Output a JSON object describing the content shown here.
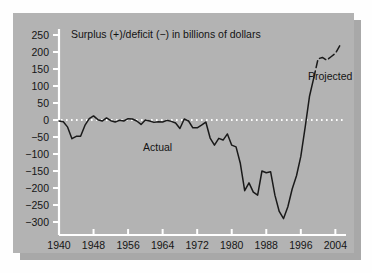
{
  "figure": {
    "panel_bg": "#b3b3b3",
    "shadow_color": "#a8a8a8",
    "page_bg": "#fefefe",
    "axis_color": "#ffffff",
    "line_color": "#1a1a1a",
    "zeroline_color": "#ffffff",
    "text_color": "#131313"
  },
  "chart_data": {
    "type": "line",
    "title": "Surplus (+)/deficit (−) in billions of dollars",
    "xlabel": "",
    "ylabel": "",
    "xlim": [
      1940,
      2006
    ],
    "ylim": [
      -300,
      250
    ],
    "grid": false,
    "legend": "none",
    "zero_line": 0,
    "xticks": [
      1940,
      1948,
      1956,
      1964,
      1972,
      1980,
      1988,
      1996,
      2004
    ],
    "xtick_labels": [
      "1940",
      "1948",
      "1956",
      "1964",
      "1972",
      "1980",
      "1988",
      "1996",
      "2004"
    ],
    "yticks": [
      250,
      200,
      150,
      100,
      50,
      0,
      -50,
      -100,
      -150,
      -200,
      -250,
      -300
    ],
    "ytick_labels": [
      "250",
      "200",
      "150",
      "100",
      "50",
      "0",
      "−50",
      "−100",
      "−150",
      "−200",
      "−250",
      "−300"
    ],
    "annotations": [
      {
        "text": "Actual",
        "x": 1966,
        "y": -55
      },
      {
        "text": "Projected",
        "x": 1999,
        "y": 160
      }
    ],
    "series": [
      {
        "name": "Actual",
        "style": "solid",
        "x": [
          1940,
          1941,
          1942,
          1943,
          1944,
          1945,
          1946,
          1947,
          1948,
          1949,
          1950,
          1951,
          1952,
          1953,
          1954,
          1955,
          1956,
          1957,
          1958,
          1959,
          1960,
          1961,
          1962,
          1963,
          1964,
          1965,
          1966,
          1967,
          1968,
          1969,
          1970,
          1971,
          1972,
          1973,
          1974,
          1975,
          1976,
          1977,
          1978,
          1979,
          1980,
          1981,
          1982,
          1983,
          1984,
          1985,
          1986,
          1987,
          1988,
          1989,
          1990,
          1991,
          1992,
          1993,
          1994,
          1995,
          1996,
          1997,
          1998,
          1999
        ],
        "values": [
          -3,
          -5,
          -21,
          -55,
          -48,
          -48,
          -16,
          4,
          12,
          1,
          -3,
          6,
          -2,
          -6,
          -1,
          -3,
          4,
          3,
          -3,
          -13,
          0,
          -3,
          -7,
          -5,
          -6,
          -1,
          -4,
          -9,
          -25,
          3,
          -3,
          -23,
          -23,
          -15,
          -6,
          -53,
          -74,
          -54,
          -59,
          -41,
          -74,
          -79,
          -128,
          -208,
          -185,
          -212,
          -221,
          -150,
          -155,
          -152,
          -221,
          -269,
          -290,
          -255,
          -203,
          -164,
          -107,
          -22,
          69,
          124
        ]
      },
      {
        "name": "Projected",
        "style": "dashed",
        "x": [
          1999,
          2000,
          2001,
          2002,
          2003,
          2004,
          2005
        ],
        "values": [
          124,
          180,
          184,
          176,
          186,
          196,
          218
        ]
      }
    ]
  }
}
